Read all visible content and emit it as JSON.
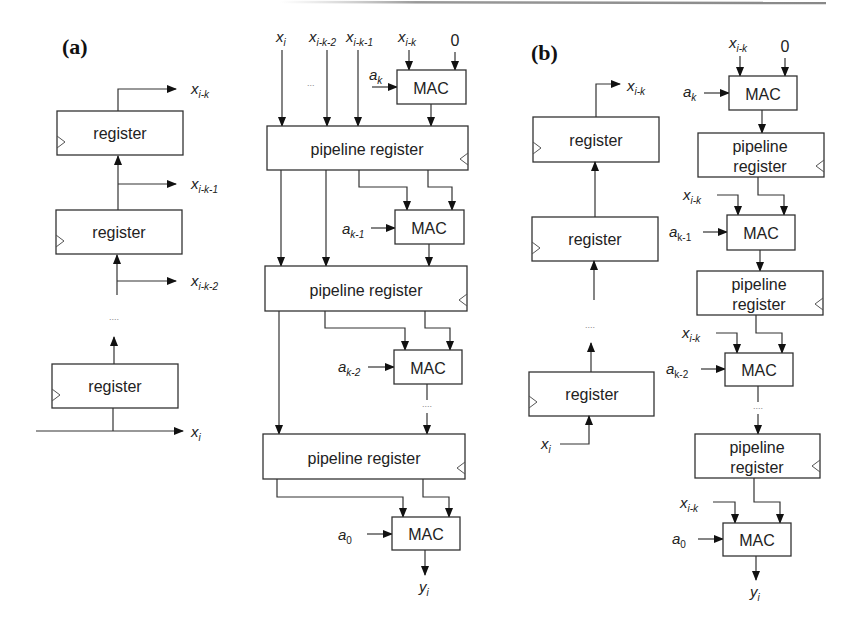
{
  "figure": {
    "panels": [
      {
        "id": "a",
        "label": "(a)"
      },
      {
        "id": "b",
        "label": "(b)"
      }
    ]
  },
  "labels": {
    "register": "register",
    "pipeline_register": "pipeline register",
    "pipeline_line1": "pipeline",
    "pipeline_line2": "register",
    "mac": "MAC",
    "ellipsis": "....",
    "ellipsis_short": "...",
    "zero": "0"
  },
  "panel_a": {
    "shift_register": {
      "outputs": [
        {
          "base": "x",
          "sub": "i-k"
        },
        {
          "base": "x",
          "sub": "i-k-1"
        },
        {
          "base": "x",
          "sub": "i-k-2"
        }
      ],
      "input": {
        "base": "x",
        "sub": "i"
      }
    },
    "mac_chain": {
      "top_inputs": [
        {
          "base": "x",
          "sub": "i"
        },
        {
          "base": "x",
          "sub": "i-k-2"
        },
        {
          "base": "x",
          "sub": "i-k-1"
        },
        {
          "base": "x",
          "sub": "i-k"
        }
      ],
      "coefficients": [
        {
          "base": "a",
          "sub": "k"
        },
        {
          "base": "a",
          "sub": "k-1"
        },
        {
          "base": "a",
          "sub": "k-2"
        },
        {
          "base": "a",
          "sub": "0"
        }
      ],
      "output": {
        "base": "y",
        "sub": "i"
      }
    }
  },
  "panel_b": {
    "shift_register": {
      "output": {
        "base": "x",
        "sub": "i-k"
      },
      "input": {
        "base": "x",
        "sub": "i"
      }
    },
    "mac_chain": {
      "top_input": {
        "base": "x",
        "sub": "i-k"
      },
      "side_inputs": [
        {
          "base": "x",
          "sub": "i-k"
        },
        {
          "base": "x",
          "sub": "i-k"
        },
        {
          "base": "x",
          "sub": "i-k"
        }
      ],
      "coefficients": [
        {
          "base": "a",
          "sub": "k"
        },
        {
          "base": "a",
          "sub": "k-1"
        },
        {
          "base": "a",
          "sub": "k-2"
        },
        {
          "base": "a",
          "sub": "0"
        }
      ],
      "output": {
        "base": "y",
        "sub": "i"
      }
    }
  }
}
